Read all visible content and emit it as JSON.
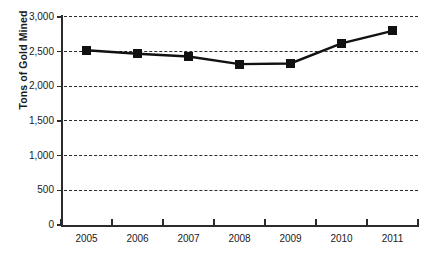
{
  "chart_data": {
    "type": "line",
    "title": "",
    "xlabel": "",
    "ylabel": "Tons of Gold Mined",
    "categories": [
      "2005",
      "2006",
      "2007",
      "2008",
      "2009",
      "2010",
      "2011"
    ],
    "values": [
      2520,
      2470,
      2430,
      2320,
      2330,
      2620,
      2800
    ],
    "series": [
      {
        "name": "Tons of Gold Mined",
        "values": [
          2520,
          2470,
          2430,
          2320,
          2330,
          2620,
          2800
        ]
      }
    ],
    "ylim": [
      0,
      3000
    ],
    "ytick_labels": [
      "3,000",
      "2,500",
      "2,000",
      "1,500",
      "1,000",
      "500",
      "0"
    ],
    "ytick_values": [
      3000,
      2500,
      2000,
      1500,
      1000,
      500,
      0
    ],
    "grid": true,
    "grid_style": "dashed-horizontal",
    "legend": "none",
    "marker": "square",
    "colors": {
      "line": "#111111",
      "marker": "#111111",
      "axis": "#2b2b2b",
      "grid": "#2b2b2b",
      "background": "#ffffff",
      "text": "#1a1a1a"
    }
  }
}
